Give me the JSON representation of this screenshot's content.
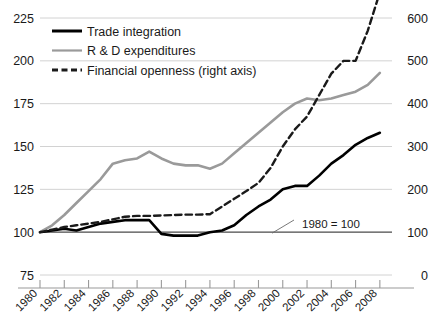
{
  "chart_data": {
    "type": "line",
    "title": "",
    "subtitle": "",
    "xlabel": "",
    "ylabel": "",
    "y2label": "",
    "grid": true,
    "legend_position": "top-left",
    "annotation": "1980 = 100",
    "ylim": [
      75,
      225
    ],
    "yticks": [
      "75",
      "100",
      "125",
      "150",
      "175",
      "200",
      "225"
    ],
    "y2lim": [
      0,
      600
    ],
    "y2ticks": [
      "0",
      "100",
      "200",
      "300",
      "400",
      "500",
      "600"
    ],
    "xlim": [
      1980,
      2009
    ],
    "xticks": [
      "1980",
      "1982",
      "1984",
      "1986",
      "1988",
      "1990",
      "1992",
      "1994",
      "1996",
      "1998",
      "2000",
      "2002",
      "2004",
      "2006",
      "2008"
    ],
    "x": [
      1980,
      1981,
      1982,
      1983,
      1984,
      1985,
      1986,
      1987,
      1988,
      1989,
      1990,
      1991,
      1992,
      1993,
      1994,
      1995,
      1996,
      1997,
      1998,
      1999,
      2000,
      2001,
      2002,
      2003,
      2004,
      2005,
      2006,
      2007,
      2008
    ],
    "series": [
      {
        "name": "Trade integration",
        "axis": "left",
        "color": "#000000",
        "style": "solid",
        "width": 2.6,
        "values": [
          100,
          101,
          102,
          101,
          103,
          105,
          106,
          107,
          107,
          107,
          99,
          98,
          98,
          98,
          100,
          101,
          104,
          110,
          115,
          119,
          125,
          127,
          127,
          133,
          140,
          145,
          151,
          155,
          158
        ]
      },
      {
        "name": "R & D expenditures",
        "axis": "left",
        "color": "#9a9a9a",
        "style": "solid",
        "width": 2.6,
        "values": [
          100,
          104,
          110,
          117,
          124,
          131,
          140,
          142,
          143,
          147,
          143,
          140,
          139,
          139,
          137,
          140,
          146,
          152,
          158,
          164,
          170,
          175,
          178,
          177,
          178,
          180,
          182,
          186,
          193
        ]
      },
      {
        "name": "Financial openness (right axis)",
        "axis": "right",
        "color": "#1a1a1a",
        "style": "dashed",
        "width": 2.4,
        "values": [
          100,
          106,
          112,
          116,
          120,
          124,
          130,
          136,
          138,
          138,
          139,
          140,
          141,
          141,
          142,
          160,
          178,
          196,
          215,
          250,
          300,
          340,
          370,
          420,
          470,
          500,
          500,
          570,
          660
        ]
      }
    ]
  },
  "legend": {
    "items": [
      {
        "label": "Trade integration",
        "marker": "solid-thick-black"
      },
      {
        "label": "R & D expenditures",
        "marker": "solid-gray"
      },
      {
        "label": "Financial openness (right axis)",
        "marker": "dashed-black"
      }
    ]
  }
}
